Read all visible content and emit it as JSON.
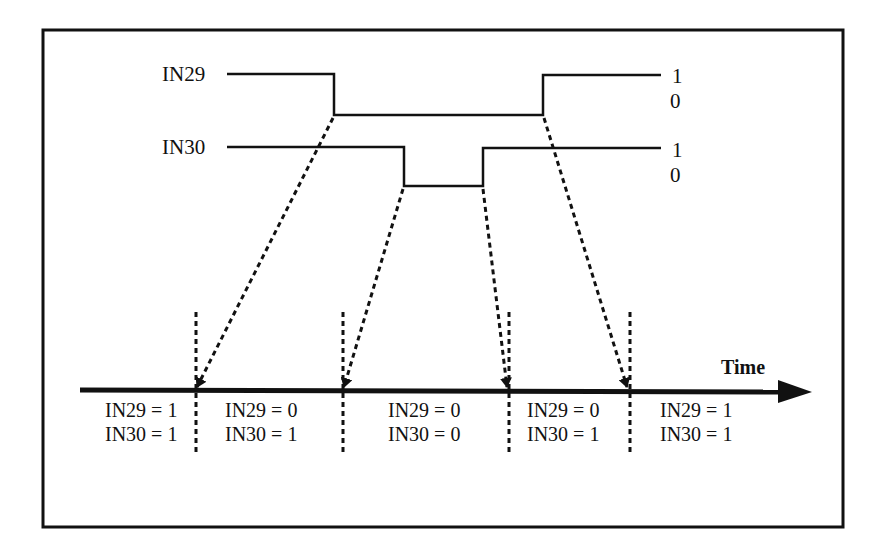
{
  "diagram": {
    "type": "timing-diagram",
    "signals": [
      {
        "name": "IN29",
        "high_label": "1",
        "low_label": "0",
        "transitions": [
          "1->0",
          "0->1"
        ]
      },
      {
        "name": "IN30",
        "high_label": "1",
        "low_label": "0",
        "transitions": [
          "1->0",
          "0->1"
        ]
      }
    ],
    "axis_label": "Time",
    "states": [
      {
        "line1": "IN29 = 1",
        "line2": "IN30 = 1"
      },
      {
        "line1": "IN29 = 0",
        "line2": "IN30 = 1"
      },
      {
        "line1": "IN29 = 0",
        "line2": "IN30 = 0"
      },
      {
        "line1": "IN29 = 0",
        "line2": "IN30 = 1"
      },
      {
        "line1": "IN29 = 1",
        "line2": "IN30 = 1"
      }
    ],
    "colors": {
      "line": "#111111",
      "background": "#ffffff"
    }
  }
}
